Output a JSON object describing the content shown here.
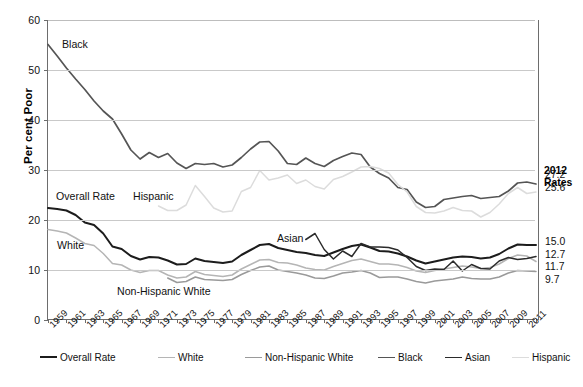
{
  "axis": {
    "ylabel": "Per cent Poor",
    "yticks": [
      "0",
      "10",
      "20",
      "30",
      "40",
      "50",
      "60"
    ],
    "xticks": [
      "1959",
      "1961",
      "1963",
      "1965",
      "1967",
      "1969",
      "1971",
      "1973",
      "1975",
      "1977",
      "1979",
      "1981",
      "1983",
      "1985",
      "1987",
      "1989",
      "1991",
      "1993",
      "1995",
      "1997",
      "1999",
      "2001",
      "2003",
      "2005",
      "2007",
      "2009",
      "2011"
    ]
  },
  "annotations": [
    {
      "name": "annotation-black",
      "text": "Black",
      "x": 62,
      "y": 38
    },
    {
      "name": "annotation-hispanic",
      "text": "Hispanic",
      "x": 133,
      "y": 190
    },
    {
      "name": "annotation-overall-rate",
      "text": "Overall Rate",
      "x": 56,
      "y": 190
    },
    {
      "name": "annotation-white",
      "text": "White",
      "x": 57,
      "y": 239
    },
    {
      "name": "annotation-asian",
      "text": "Asian",
      "x": 277,
      "y": 232
    },
    {
      "name": "annotation-non-hispanic-white",
      "text": "Non-Hispanic White",
      "x": 117,
      "y": 285
    }
  ],
  "rates_panel": {
    "title_line1": "2012",
    "title_line2": "Rates",
    "entries": [
      {
        "series": "Black",
        "value": "27.2",
        "y": 169
      },
      {
        "series": "Hispanic",
        "value": "25.6",
        "y": 182
      },
      {
        "series": "Overall Rate",
        "value": "15.0",
        "y": 236
      },
      {
        "series": "Asian",
        "value": "12.7",
        "y": 249
      },
      {
        "series": "White",
        "value": "11.7",
        "y": 261
      },
      {
        "series": "Non-Hispanic White",
        "value": "9.7",
        "y": 274
      }
    ]
  },
  "legend": {
    "items": [
      {
        "label": "Overall Rate",
        "color": "#1c1c1c",
        "width": 2.0,
        "x": 0
      },
      {
        "label": "White",
        "color": "#b5b5b5",
        "width": 1.4,
        "x": 118
      },
      {
        "label": "Non-Hispanic White",
        "color": "#9a9a9a",
        "width": 1.4,
        "x": 205
      },
      {
        "label": "Black",
        "color": "#555555",
        "width": 1.8,
        "x": 338
      },
      {
        "label": "Asian",
        "color": "#2b2b2b",
        "width": 1.6,
        "x": 405
      },
      {
        "label": "Hispanic",
        "color": "#dcdcdc",
        "width": 1.6,
        "x": 472
      }
    ]
  },
  "caption": {
    "text": ""
  },
  "chart_data": {
    "type": "line",
    "title": "",
    "xlabel": "",
    "ylabel": "Per cent Poor",
    "ylim": [
      0,
      60
    ],
    "xlim": [
      1959,
      2012
    ],
    "grid": true,
    "legend_position": "bottom",
    "x": [
      1959,
      1960,
      1961,
      1962,
      1963,
      1964,
      1965,
      1966,
      1967,
      1968,
      1969,
      1970,
      1971,
      1972,
      1973,
      1974,
      1975,
      1976,
      1977,
      1978,
      1979,
      1980,
      1981,
      1982,
      1983,
      1984,
      1985,
      1986,
      1987,
      1988,
      1989,
      1990,
      1991,
      1992,
      1993,
      1994,
      1995,
      1996,
      1997,
      1998,
      1999,
      2000,
      2001,
      2002,
      2003,
      2004,
      2005,
      2006,
      2007,
      2008,
      2009,
      2010,
      2011,
      2012
    ],
    "series": [
      {
        "name": "Overall Rate",
        "color": "#1c1c1c",
        "final_2012": 15.0,
        "values": [
          22.4,
          22.2,
          21.9,
          21.0,
          19.5,
          19.0,
          17.3,
          14.7,
          14.2,
          12.8,
          12.1,
          12.6,
          12.5,
          11.9,
          11.1,
          11.2,
          12.3,
          11.8,
          11.6,
          11.4,
          11.7,
          13.0,
          14.0,
          15.0,
          15.2,
          14.4,
          14.0,
          13.6,
          13.4,
          13.0,
          12.8,
          13.5,
          14.2,
          14.8,
          15.1,
          14.5,
          13.8,
          13.7,
          13.3,
          12.7,
          11.9,
          11.3,
          11.7,
          12.1,
          12.5,
          12.7,
          12.6,
          12.3,
          12.5,
          13.2,
          14.3,
          15.1,
          15.0,
          15.0
        ]
      },
      {
        "name": "White",
        "color": "#b5b5b5",
        "final_2012": 11.7,
        "values": [
          18.1,
          17.8,
          17.4,
          16.4,
          15.3,
          14.9,
          13.3,
          11.3,
          11.0,
          10.0,
          9.5,
          9.9,
          9.9,
          9.0,
          8.4,
          8.6,
          9.7,
          9.1,
          8.9,
          8.7,
          9.0,
          10.2,
          11.1,
          12.0,
          12.1,
          11.5,
          11.4,
          11.0,
          10.4,
          10.1,
          10.0,
          10.7,
          11.3,
          11.9,
          12.2,
          11.7,
          11.2,
          11.2,
          11.0,
          10.5,
          9.8,
          9.5,
          9.9,
          10.2,
          10.5,
          10.8,
          10.6,
          10.3,
          10.5,
          11.2,
          12.3,
          13.0,
          12.8,
          11.7
        ]
      },
      {
        "name": "Non-Hispanic White",
        "color": "#9a9a9a",
        "final_2012": 9.7,
        "values": [
          null,
          null,
          null,
          null,
          null,
          null,
          null,
          null,
          null,
          null,
          null,
          null,
          null,
          8.4,
          7.5,
          7.7,
          8.6,
          8.1,
          8.0,
          7.9,
          8.1,
          9.1,
          9.9,
          10.6,
          10.8,
          10.0,
          9.7,
          9.4,
          9.0,
          8.4,
          8.3,
          8.8,
          9.4,
          9.6,
          9.9,
          9.4,
          8.5,
          8.6,
          8.6,
          8.2,
          7.7,
          7.4,
          7.8,
          8.0,
          8.2,
          8.6,
          8.3,
          8.2,
          8.2,
          8.6,
          9.4,
          9.9,
          9.8,
          9.7
        ]
      },
      {
        "name": "Black",
        "color": "#555555",
        "final_2012": 27.2,
        "values": [
          55.1,
          52.8,
          50.4,
          48.2,
          46.1,
          43.8,
          41.8,
          40.2,
          37.2,
          34.0,
          32.2,
          33.5,
          32.5,
          33.3,
          31.4,
          30.3,
          31.3,
          31.1,
          31.3,
          30.6,
          31.0,
          32.5,
          34.2,
          35.6,
          35.7,
          33.8,
          31.3,
          31.1,
          32.4,
          31.3,
          30.7,
          31.9,
          32.7,
          33.4,
          33.1,
          30.6,
          29.3,
          28.4,
          26.5,
          26.1,
          23.6,
          22.5,
          22.7,
          24.1,
          24.4,
          24.7,
          24.9,
          24.3,
          24.5,
          24.7,
          25.8,
          27.4,
          27.6,
          27.2
        ]
      },
      {
        "name": "Asian",
        "color": "#2b2b2b",
        "final_2012": 12.7,
        "values": [
          null,
          null,
          null,
          null,
          null,
          null,
          null,
          null,
          null,
          null,
          null,
          null,
          null,
          null,
          null,
          null,
          null,
          null,
          null,
          null,
          null,
          null,
          null,
          null,
          null,
          null,
          null,
          null,
          16.1,
          17.3,
          14.1,
          12.2,
          13.8,
          12.7,
          15.3,
          14.6,
          14.6,
          14.5,
          14.0,
          12.5,
          10.7,
          9.9,
          10.2,
          10.1,
          11.8,
          9.8,
          11.1,
          10.3,
          10.2,
          11.8,
          12.5,
          12.1,
          12.3,
          12.7
        ]
      },
      {
        "name": "Hispanic",
        "color": "#dcdcdc",
        "final_2012": 25.6,
        "values": [
          null,
          null,
          null,
          null,
          null,
          null,
          null,
          null,
          null,
          null,
          null,
          null,
          22.8,
          21.9,
          21.9,
          23.0,
          26.9,
          24.7,
          22.4,
          21.6,
          21.8,
          25.7,
          26.5,
          29.9,
          28.0,
          28.4,
          29.0,
          27.3,
          28.0,
          26.7,
          26.2,
          28.1,
          28.7,
          29.6,
          30.6,
          30.7,
          30.3,
          29.4,
          27.1,
          25.6,
          22.7,
          21.5,
          21.4,
          21.8,
          22.5,
          21.9,
          21.8,
          20.6,
          21.5,
          23.2,
          25.3,
          26.5,
          25.3,
          25.6
        ]
      }
    ]
  }
}
